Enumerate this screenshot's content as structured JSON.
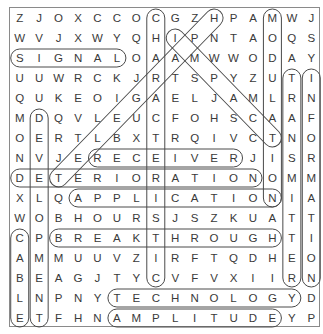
{
  "puzzle": {
    "rows": 16,
    "cols": 16,
    "grid": [
      "ZJOXCCOCGZHPAMWJ",
      "WVJXWYQHIPNTAOQS",
      "SIGNALOAAMWWODAY",
      "UUWRCKJRTSPYZUTI",
      "QUKEOIGAELJAMLRN",
      "MDQVLEUCFOHSCAAF",
      "OERTLBXTRQIVCTNO",
      "NVJERECEIVERJISR",
      "DETERIORATIONOMM",
      "XLQAPPLICATIONIA",
      "WOBHOURSJSZKUATT",
      "CPBREAKTHROUGHTI",
      "AMMUUVZIRFTQDHEO",
      "BEAGJTYCVFVXIIRN",
      "LNPNYTECHNOLOGYD",
      "ETFHNAMPLITUDEYP"
    ],
    "found_words": [
      {
        "word": "SIGNAL",
        "start": [
          3,
          1
        ],
        "end": [
          3,
          6
        ],
        "direction": "horizontal"
      },
      {
        "word": "RECEIVER",
        "start": [
          8,
          5
        ],
        "end": [
          8,
          12
        ],
        "direction": "horizontal"
      },
      {
        "word": "DETERIORATION",
        "start": [
          9,
          1
        ],
        "end": [
          9,
          13
        ],
        "direction": "horizontal"
      },
      {
        "word": "APPLICATION",
        "start": [
          10,
          4
        ],
        "end": [
          10,
          14
        ],
        "direction": "horizontal"
      },
      {
        "word": "BREAKTHROUGH",
        "start": [
          12,
          3
        ],
        "end": [
          12,
          14
        ],
        "direction": "horizontal"
      },
      {
        "word": "TECHNOLOGY",
        "start": [
          15,
          6
        ],
        "end": [
          15,
          15
        ],
        "direction": "horizontal"
      },
      {
        "word": "AMPLITUDE",
        "start": [
          16,
          6
        ],
        "end": [
          16,
          14
        ],
        "direction": "horizontal"
      },
      {
        "word": "CHARACTERISTIC",
        "start": [
          1,
          8
        ],
        "end": [
          14,
          8
        ],
        "direction": "vertical"
      },
      {
        "word": "MODULATION",
        "start": [
          1,
          14
        ],
        "end": [
          10,
          14
        ],
        "direction": "vertical"
      },
      {
        "word": "TRANSMITTER",
        "start": [
          4,
          15
        ],
        "end": [
          14,
          15
        ],
        "direction": "vertical"
      },
      {
        "word": "INFORMATION",
        "start": [
          4,
          16
        ],
        "end": [
          14,
          16
        ],
        "direction": "vertical"
      },
      {
        "word": "DEVELOPMENT",
        "start": [
          6,
          2
        ],
        "end": [
          16,
          2
        ],
        "direction": "vertical"
      },
      {
        "word": "CABLE",
        "start": [
          12,
          1
        ],
        "end": [
          16,
          1
        ],
        "direction": "vertical"
      },
      {
        "word": "TELEGRAPH",
        "start": [
          9,
          3
        ],
        "end": [
          1,
          11
        ],
        "direction": "diagonal-up-right"
      },
      {
        "word": "IMPACT",
        "start": [
          2,
          9
        ],
        "end": [
          7,
          14
        ],
        "direction": "diagonal-down-right"
      }
    ],
    "colors": {
      "letter": "#3a3a3a",
      "oval_stroke": "#4a4a4a",
      "border": "#8a8a8a",
      "background": "#ffffff"
    }
  }
}
